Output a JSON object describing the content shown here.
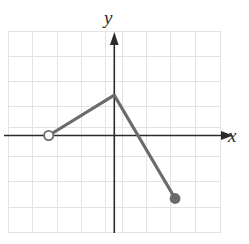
{
  "figure": {
    "title": "",
    "axis_labels": {
      "x": "x",
      "y": "y"
    },
    "colors": {
      "grid": "#e2e2e6",
      "axis": "#2a2a2a",
      "curve": "#6b6b6b",
      "open_point_stroke": "#6b6b6b",
      "open_point_fill": "#ffffff",
      "closed_point_fill": "#6b6b6b",
      "background": "#ffffff"
    }
  },
  "chart_data": {
    "type": "line",
    "title": "",
    "xlabel": "x",
    "ylabel": "y",
    "grid": true,
    "legend": "none",
    "xlim": [
      -4.4,
      4.4
    ],
    "ylim": [
      -3.9,
      4.1
    ],
    "xticks": [
      -4,
      -3,
      -2,
      -1,
      0,
      1,
      2,
      3,
      4
    ],
    "yticks": [
      -3,
      -2,
      -1,
      0,
      1,
      2,
      3,
      4
    ],
    "tick_labels_shown": false,
    "axis_arrows": {
      "x_positive": true,
      "y_positive": true
    },
    "series": [
      {
        "name": "piecewise-linear-graph",
        "points": [
          {
            "x": -2.7,
            "y": 0.0,
            "marker": "open-circle"
          },
          {
            "x": 0.0,
            "y": 1.6,
            "marker": "none"
          },
          {
            "x": 2.5,
            "y": -2.5,
            "marker": "closed-circle"
          }
        ],
        "segments": [
          {
            "from": [
              -2.7,
              0.0
            ],
            "to": [
              0.0,
              1.6
            ]
          },
          {
            "from": [
              0.0,
              1.6
            ],
            "to": [
              2.5,
              -2.5
            ]
          }
        ]
      }
    ],
    "endpoints": [
      {
        "kind": "open",
        "x": -2.7,
        "y": 0.0,
        "included": false
      },
      {
        "kind": "closed",
        "x": 2.5,
        "y": -2.5,
        "included": true
      }
    ]
  }
}
